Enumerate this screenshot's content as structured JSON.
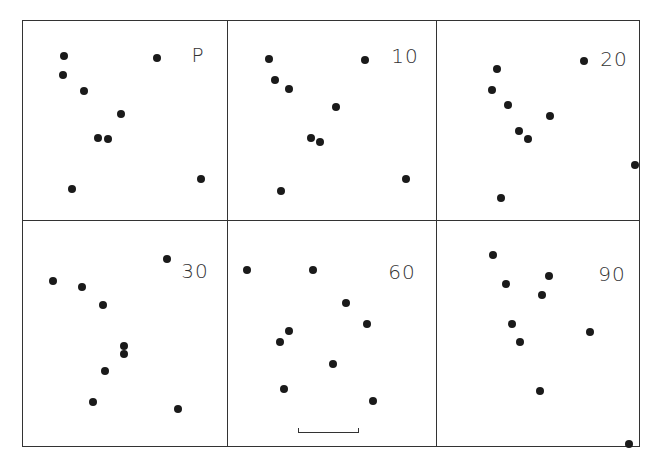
{
  "figure": {
    "bounds": {
      "left": 22,
      "top": 20,
      "right": 640,
      "bottom": 447
    },
    "col_dividers": [
      227,
      436
    ],
    "row_divider": 220,
    "panels": [
      {
        "label": "P",
        "label_pos": [
          198,
          55
        ],
        "dots": [
          [
            64,
            56
          ],
          [
            63,
            75
          ],
          [
            84,
            91
          ],
          [
            121,
            114
          ],
          [
            98,
            138
          ],
          [
            108,
            139
          ],
          [
            72,
            189
          ],
          [
            157,
            58
          ],
          [
            201,
            179
          ]
        ]
      },
      {
        "label": "10",
        "label_pos": [
          405,
          56
        ],
        "dots": [
          [
            269,
            59
          ],
          [
            275,
            80
          ],
          [
            289,
            89
          ],
          [
            336,
            107
          ],
          [
            311,
            138
          ],
          [
            320,
            142
          ],
          [
            281,
            191
          ],
          [
            365,
            60
          ],
          [
            406,
            179
          ]
        ]
      },
      {
        "label": "20",
        "label_pos": [
          614,
          59
        ],
        "dots": [
          [
            497,
            69
          ],
          [
            492,
            90
          ],
          [
            508,
            105
          ],
          [
            550,
            116
          ],
          [
            519,
            131
          ],
          [
            528,
            139
          ],
          [
            501,
            198
          ],
          [
            584,
            61
          ],
          [
            635,
            165
          ]
        ]
      },
      {
        "label": "30",
        "label_pos": [
          195,
          271
        ],
        "dots": [
          [
            53,
            281
          ],
          [
            82,
            287
          ],
          [
            103,
            305
          ],
          [
            167,
            259
          ],
          [
            124,
            346
          ],
          [
            124,
            354
          ],
          [
            105,
            371
          ],
          [
            93,
            402
          ],
          [
            178,
            409
          ]
        ]
      },
      {
        "label": "60",
        "label_pos": [
          402,
          272
        ],
        "dots": [
          [
            247,
            270
          ],
          [
            313,
            270
          ],
          [
            346,
            303
          ],
          [
            367,
            324
          ],
          [
            289,
            331
          ],
          [
            280,
            342
          ],
          [
            333,
            364
          ],
          [
            284,
            389
          ],
          [
            373,
            401
          ]
        ]
      },
      {
        "label": "90",
        "label_pos": [
          612,
          274
        ],
        "dots": [
          [
            493,
            255
          ],
          [
            506,
            284
          ],
          [
            549,
            276
          ],
          [
            542,
            295
          ],
          [
            512,
            324
          ],
          [
            520,
            342
          ],
          [
            590,
            332
          ],
          [
            540,
            391
          ],
          [
            629,
            444
          ]
        ]
      }
    ],
    "scale_bar": {
      "x1": 298,
      "x2": 359,
      "y": 432
    }
  }
}
